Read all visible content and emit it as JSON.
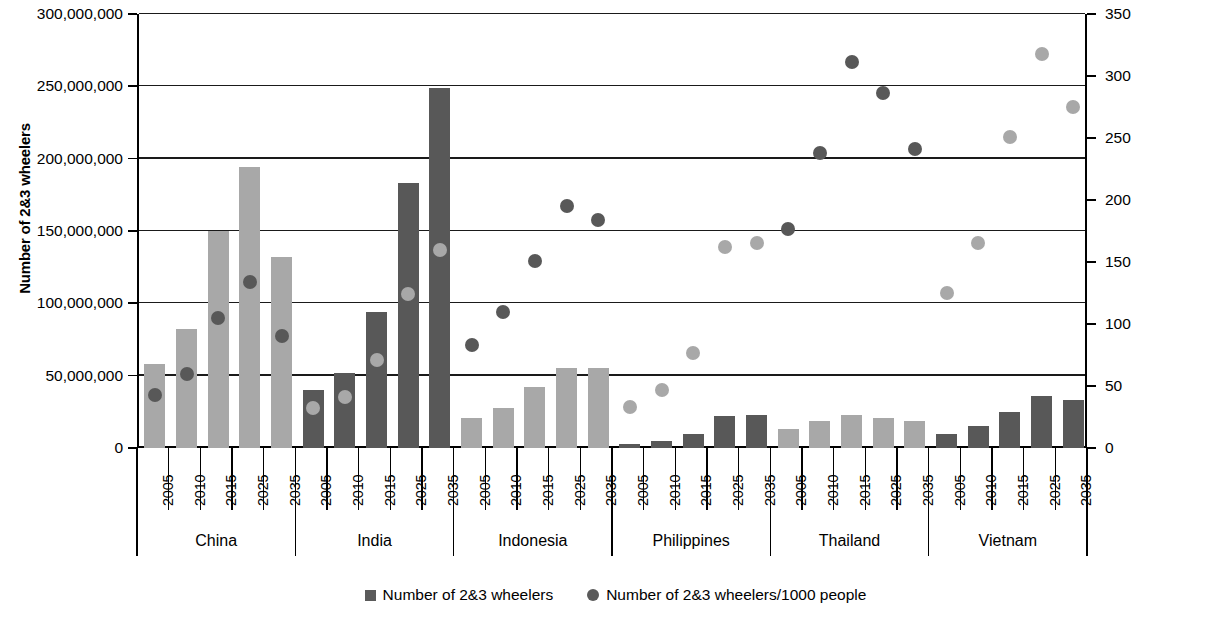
{
  "chart_data": {
    "type": "bar",
    "title": "",
    "categories": [
      "2005",
      "2010",
      "2015",
      "2025",
      "2035"
    ],
    "groups": [
      "China",
      "India",
      "Indonesia",
      "Philippines",
      "Thailand",
      "Vietnam"
    ],
    "ylabel": "Number of 2&3 wheelers",
    "y2label": "Number of 2&3 wheelers/1000 people",
    "xlabel": "",
    "ylim": [
      0,
      300000000
    ],
    "y2lim": [
      0,
      350
    ],
    "ytick_labels": [
      "0",
      "50,000,000",
      "100,000,000",
      "150,000,000",
      "200,000,000",
      "250,000,000",
      "300,000,000"
    ],
    "ytick_values": [
      0,
      50000000,
      100000000,
      150000000,
      200000000,
      250000000,
      300000000
    ],
    "y2tick_labels": [
      "0",
      "50",
      "100",
      "150",
      "200",
      "250",
      "300",
      "350"
    ],
    "y2tick_values": [
      0,
      50,
      100,
      150,
      200,
      250,
      300,
      350
    ],
    "grid": true,
    "legend_position": "bottom-center",
    "series": [
      {
        "name": "Number of 2&3 wheelers",
        "marker": "square",
        "axis": "left",
        "data": {
          "China": [
            58000000,
            82000000,
            150000000,
            194000000,
            132000000
          ],
          "India": [
            40000000,
            52000000,
            94000000,
            183000000,
            249000000
          ],
          "Indonesia": [
            21000000,
            28000000,
            42000000,
            55000000,
            55000000
          ],
          "Philippines": [
            3000000,
            5000000,
            10000000,
            22000000,
            23000000
          ],
          "Thailand": [
            13000000,
            19000000,
            23000000,
            21000000,
            19000000
          ],
          "Vietnam": [
            10000000,
            15000000,
            25000000,
            36000000,
            33000000
          ]
        }
      },
      {
        "name": "Number of 2&3 wheelers/1000 people",
        "marker": "circle",
        "axis": "right",
        "data": {
          "China": [
            43,
            60,
            105,
            134,
            90
          ],
          "India": [
            32,
            41,
            71,
            124,
            160
          ],
          "Indonesia": [
            83,
            110,
            151,
            195,
            184
          ],
          "Philippines": [
            33,
            47,
            77,
            162,
            165
          ],
          "Thailand": [
            177,
            238,
            311,
            286,
            241
          ],
          "Vietnam": [
            125,
            165,
            251,
            318,
            275
          ]
        }
      }
    ],
    "group_bar_colors": {
      "China": "#a8a8a8",
      "India": "#585858",
      "Indonesia": "#a8a8a8",
      "Philippines": "#585858",
      "Thailand": "#a8a8a8",
      "Vietnam": "#585858"
    },
    "group_dot_colors": {
      "China": "#585858",
      "India": "#a8a8a8",
      "Indonesia": "#585858",
      "Philippines": "#a8a8a8",
      "Thailand": "#585858",
      "Vietnam": "#a8a8a8"
    }
  },
  "legend": {
    "items": [
      {
        "label": "Number of 2&3 wheelers",
        "marker": "square",
        "color": "#5a5a5a"
      },
      {
        "label": "Number of 2&3 wheelers/1000 people",
        "marker": "circle",
        "color": "#5a5a5a"
      }
    ]
  }
}
